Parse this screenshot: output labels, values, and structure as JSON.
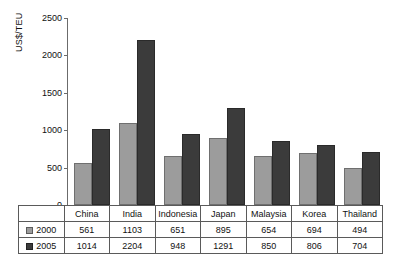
{
  "chart_data": {
    "type": "bar",
    "title": "",
    "xlabel": "",
    "ylabel": "US$/TEU",
    "ylim": [
      0,
      2500
    ],
    "yticks": [
      0,
      500,
      1000,
      1500,
      2000,
      2500
    ],
    "ytick_labels": [
      "0",
      "500",
      "1000",
      "1500",
      "2000",
      "2500"
    ],
    "grid": false,
    "legend_position": "table-row-labels",
    "categories": [
      "China",
      "India",
      "Indonesia",
      "Japan",
      "Malaysia",
      "Korea",
      "Thailand"
    ],
    "series": [
      {
        "name": "2000",
        "color": "#9c9c9c",
        "values": [
          561,
          1103,
          651,
          895,
          654,
          694,
          494
        ]
      },
      {
        "name": "2005",
        "color": "#3b3b3b",
        "values": [
          1014,
          2204,
          948,
          1291,
          850,
          806,
          704
        ]
      }
    ]
  },
  "table": {
    "header_row": [
      "China",
      "India",
      "Indonesia",
      "Japan",
      "Malaysia",
      "Korea",
      "Thailand"
    ],
    "rows": [
      {
        "label": "2000",
        "swatch": "light-gray-square",
        "values": [
          "561",
          "1103",
          "651",
          "895",
          "654",
          "694",
          "494"
        ]
      },
      {
        "label": "2005",
        "swatch": "dark-gray-square",
        "values": [
          "1014",
          "2204",
          "948",
          "1291",
          "850",
          "806",
          "704"
        ]
      }
    ]
  }
}
